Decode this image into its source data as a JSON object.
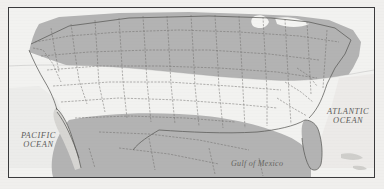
{
  "figure": {
    "kind": "reference-map",
    "frame": {
      "border_color": "#3a3a3c",
      "inset_px": 8
    },
    "page_background": "#f0efed"
  },
  "colors": {
    "shaded_region": "#b3b3b3",
    "unshaded_region": "#f2f2f0",
    "water": "#eceae6",
    "boundary_line": "#6e6d6b",
    "coastline": "#5a5957",
    "label_text": "#5d5c5a",
    "frame": "#3a3a3c"
  },
  "labels": {
    "pacific_ocean": "PACIFIC\nOCEAN",
    "atlantic_ocean": "ATLANTIC\nOCEAN",
    "gulf_of_mexico": "Gulf of Mexico"
  },
  "legend": {
    "shaded_meaning": "shaded region",
    "unshaded_meaning": "unshaded region"
  },
  "map_features": {
    "shaded_area": "northern and eastern United States, plus Florida peninsula and northern Mexico",
    "unshaded_area": "southwestern interior, Texas, and Gulf coast states",
    "boundary_style": "thin dashed state outlines",
    "great_lakes": "rendered as white water shapes in the north-central region",
    "peninsulas": [
      "Baja California",
      "Florida"
    ],
    "islands": [
      "Caribbean islands at lower right"
    ]
  }
}
